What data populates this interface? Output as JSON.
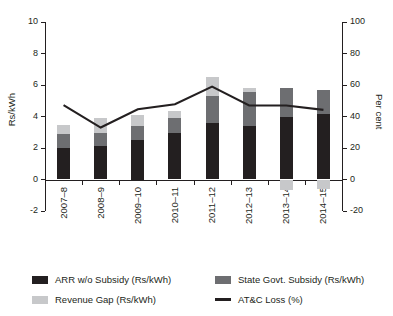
{
  "chart_data": {
    "type": "bar",
    "title": "",
    "subtitle": "",
    "categories": [
      "2007–8",
      "2008–9",
      "2009–10",
      "2010–11",
      "2011–12",
      "2012–13",
      "2013–14",
      "2014–15"
    ],
    "series": [
      {
        "name": "ARR w/o Subsidy (Rs/kWh)",
        "type": "bar",
        "axis": "left",
        "color": "#231f20",
        "values": [
          2.02,
          2.14,
          2.5,
          2.98,
          3.58,
          3.38,
          3.96,
          4.14
        ]
      },
      {
        "name": "State Govt. Subsidy (Rs/kWh)",
        "type": "bar",
        "axis": "left",
        "color": "#6d6e71",
        "values": [
          0.86,
          0.82,
          0.88,
          0.9,
          1.72,
          2.2,
          1.88,
          1.52
        ]
      },
      {
        "name": "Revenue Gap (Rs/kWh)",
        "type": "bar",
        "axis": "left",
        "color": "#c7c8ca",
        "values": [
          0.6,
          0.94,
          0.74,
          0.5,
          1.22,
          0.22,
          -0.66,
          -0.62
        ]
      },
      {
        "name": "AT&C Loss (%)",
        "type": "line",
        "axis": "right",
        "color": "#231f20",
        "values": [
          47.2,
          33.0,
          44.6,
          47.8,
          59.0,
          47.0,
          47.0,
          44.2
        ]
      }
    ],
    "xlabel": "",
    "ylabel_left": "Rs/kWh",
    "ylabel_right": "Per cent",
    "ylim_left": [
      -2,
      10
    ],
    "ylim_right": [
      -20,
      100
    ],
    "ytick_left": [
      "10",
      "8",
      "6",
      "4",
      "2",
      "0",
      "-2"
    ],
    "ytick_left_values": [
      10,
      8,
      6,
      4,
      2,
      0,
      -2
    ],
    "ytick_right": [
      "100",
      "80",
      "60",
      "40",
      "20",
      "0",
      "-20"
    ],
    "ytick_right_values": [
      100,
      80,
      60,
      40,
      20,
      0,
      -20
    ],
    "grid": false,
    "legend_position": "bottom",
    "stacked": true
  },
  "legend": {
    "items": [
      {
        "label": "ARR w/o Subsidy (Rs/kWh)",
        "color": "#231f20",
        "marker": "swatch"
      },
      {
        "label": "State Govt. Subsidy (Rs/kWh)",
        "color": "#6d6e71",
        "marker": "swatch"
      },
      {
        "label": "Revenue Gap (Rs/kWh)",
        "color": "#c7c8ca",
        "marker": "swatch"
      },
      {
        "label": "AT&C Loss (%)",
        "color": "#231f20",
        "marker": "line"
      }
    ]
  }
}
